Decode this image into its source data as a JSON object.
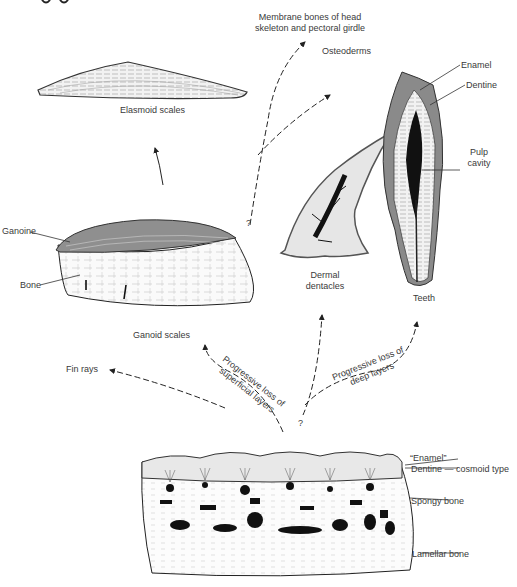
{
  "figure": {
    "title_fragment": "...ygo...",
    "colors": {
      "ink": "#222222",
      "enamel_gray": "#8a8a8a",
      "dentine_light": "#e4e4e4",
      "pulp_black": "#111111",
      "label_text": "#3a3a3a"
    }
  },
  "structures": {
    "elasmoid": {
      "label": "Elasmoid scales"
    },
    "ganoid": {
      "label": "Ganoid scales",
      "parts": {
        "ganoine": "Ganoine",
        "bone": "Bone"
      }
    },
    "dentacles": {
      "label_line1": "Dermal",
      "label_line2": "dentacles"
    },
    "teeth": {
      "label": "Teeth",
      "parts": {
        "enamel": "Enamel",
        "dentine": "Dentine",
        "pulp_line1": "Pulp",
        "pulp_line2": "cavity"
      }
    },
    "cosmoid": {
      "parts": {
        "enamel": "“Enamel”",
        "dentine": "Dentine — cosmoid type",
        "spongy": "Spongy bone",
        "lamellar": "Lamellar bone"
      }
    }
  },
  "derivatives": {
    "membrane_bones_line1": "Membrane bones of head",
    "membrane_bones_line2": "skeleton and pectoral girdle",
    "osteoderms": "Osteoderms",
    "fin_rays": "Fin rays"
  },
  "pathways": {
    "superficial_line1": "Progressive loss of",
    "superficial_line2": "superficial layers",
    "deep_line1": "Progressive loss of",
    "deep_line2": "deep layers",
    "uncertain_mark_1": "?",
    "uncertain_mark_2": "?"
  }
}
